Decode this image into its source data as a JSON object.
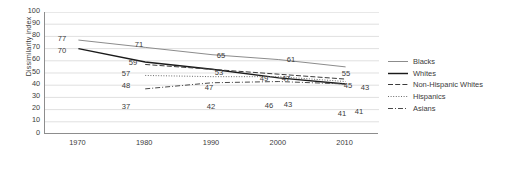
{
  "chart_data": {
    "type": "line",
    "title": "",
    "xlabel": "",
    "ylabel": "Dissimilarity index",
    "categories": [
      "1970",
      "1980",
      "1990",
      "2000",
      "2010"
    ],
    "ylim": [
      0,
      100
    ],
    "ytick_step": 10,
    "yticks": [
      "100",
      "90",
      "80",
      "70",
      "60",
      "50",
      "40",
      "30",
      "20",
      "10",
      "0"
    ],
    "grid": "horizontal",
    "legend_position": "right",
    "series": [
      {
        "name": "Blacks",
        "style": "solid-thin",
        "color": "#8c8c8c",
        "x": [
          "1970",
          "1980",
          "1990",
          "2000",
          "2010"
        ],
        "values": [
          77,
          71,
          65,
          61,
          55
        ],
        "labels": [
          "77",
          "71",
          "65",
          "61",
          "55"
        ]
      },
      {
        "name": "Whites",
        "style": "solid-thick",
        "color": "#1a1a1a",
        "x": [
          "1970",
          "1980",
          "1990",
          "2000",
          "2010"
        ],
        "values": [
          70,
          59,
          53,
          46,
          41
        ],
        "labels": [
          "70",
          "59",
          "53",
          "46",
          "41"
        ]
      },
      {
        "name": "Non-Hispanic Whites",
        "style": "dashed",
        "color": "#3b3b3b",
        "x": [
          "1980",
          "1990",
          "2000",
          "2010"
        ],
        "values": [
          57,
          53,
          49,
          45
        ],
        "labels": [
          "57",
          "",
          "49",
          "45"
        ]
      },
      {
        "name": "Hispanics",
        "style": "dotted",
        "color": "#6b6b6b",
        "x": [
          "1980",
          "1990",
          "2000",
          "2010"
        ],
        "values": [
          48,
          47,
          47,
          43
        ],
        "labels": [
          "48",
          "47",
          "47",
          "43"
        ]
      },
      {
        "name": "Asians",
        "style": "dash-dot",
        "color": "#4a4a4a",
        "x": [
          "1980",
          "1990",
          "2000",
          "2010"
        ],
        "values": [
          37,
          42,
          43,
          41
        ],
        "labels": [
          "37",
          "42",
          "43",
          "41"
        ]
      }
    ],
    "point_labels": [
      {
        "text": "77",
        "series": "Blacks",
        "x_px": 62,
        "y_px": 39
      },
      {
        "text": "71",
        "series": "Blacks",
        "x_px": 139,
        "y_px": 45
      },
      {
        "text": "65",
        "series": "Blacks",
        "x_px": 221,
        "y_px": 56
      },
      {
        "text": "61",
        "series": "Blacks",
        "x_px": 291,
        "y_px": 60
      },
      {
        "text": "55",
        "series": "Blacks",
        "x_px": 346,
        "y_px": 74
      },
      {
        "text": "70",
        "series": "Whites",
        "x_px": 62,
        "y_px": 51
      },
      {
        "text": "59",
        "series": "Whites",
        "x_px": 133,
        "y_px": 63
      },
      {
        "text": "53",
        "series": "Whites",
        "x_px": 219,
        "y_px": 73
      },
      {
        "text": "46",
        "series": "Whites",
        "x_px": 269,
        "y_px": 106
      },
      {
        "text": "41",
        "series": "Whites",
        "x_px": 342,
        "y_px": 114
      },
      {
        "text": "57",
        "series": "Non-Hispanic Whites",
        "x_px": 126,
        "y_px": 74
      },
      {
        "text": "49",
        "series": "Non-Hispanic Whites",
        "x_px": 264,
        "y_px": 79
      },
      {
        "text": "45",
        "series": "Non-Hispanic Whites",
        "x_px": 348,
        "y_px": 86
      },
      {
        "text": "48",
        "series": "Hispanics",
        "x_px": 126,
        "y_px": 86
      },
      {
        "text": "47",
        "series": "Hispanics",
        "x_px": 209,
        "y_px": 88
      },
      {
        "text": "47",
        "series": "Hispanics",
        "x_px": 286,
        "y_px": 79
      },
      {
        "text": "43",
        "series": "Hispanics",
        "x_px": 365,
        "y_px": 88
      },
      {
        "text": "37",
        "series": "Asians",
        "x_px": 126,
        "y_px": 107
      },
      {
        "text": "42",
        "series": "Asians",
        "x_px": 211,
        "y_px": 107
      },
      {
        "text": "43",
        "series": "Asians",
        "x_px": 288,
        "y_px": 105
      },
      {
        "text": "41",
        "series": "Asians",
        "x_px": 359,
        "y_px": 112
      }
    ]
  },
  "legend": {
    "items": [
      {
        "label": "Blacks"
      },
      {
        "label": "Whites"
      },
      {
        "label": "Non-Hispanic Whites"
      },
      {
        "label": "Hispanics"
      },
      {
        "label": "Asians"
      }
    ]
  }
}
